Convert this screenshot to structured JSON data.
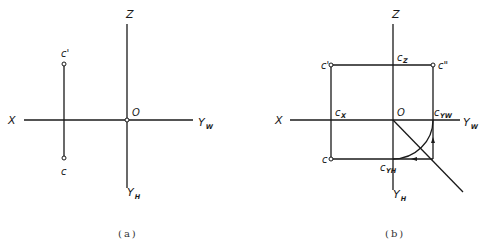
{
  "figure": {
    "panels": [
      {
        "id": "a",
        "caption": "(a)",
        "axes": {
          "x_label": "X",
          "z_label": "Z",
          "origin_label": "O",
          "yw_label_main": "Y",
          "yw_label_sub": "W",
          "yh_label_main": "Y",
          "yh_label_sub": "H"
        },
        "points": {
          "c_prime": "c'",
          "c": "c"
        }
      },
      {
        "id": "b",
        "caption": "(b)",
        "axes": {
          "x_label": "X",
          "z_label": "Z",
          "origin_label": "O",
          "yw_label_main": "Y",
          "yw_label_sub": "W",
          "yh_label_main": "Y",
          "yh_label_sub": "H"
        },
        "points": {
          "c_prime": "c'",
          "c_double_prime": "c\"",
          "c": "c",
          "cz_main": "c",
          "cz_sub": "Z",
          "cx_main": "c",
          "cx_sub": "X",
          "cyw_main": "c",
          "cyw_sub": "YW",
          "cyh_main": "c",
          "cyh_sub": "YH"
        }
      }
    ],
    "colors": {
      "line": "#1a1a1a",
      "background": "#ffffff"
    }
  }
}
